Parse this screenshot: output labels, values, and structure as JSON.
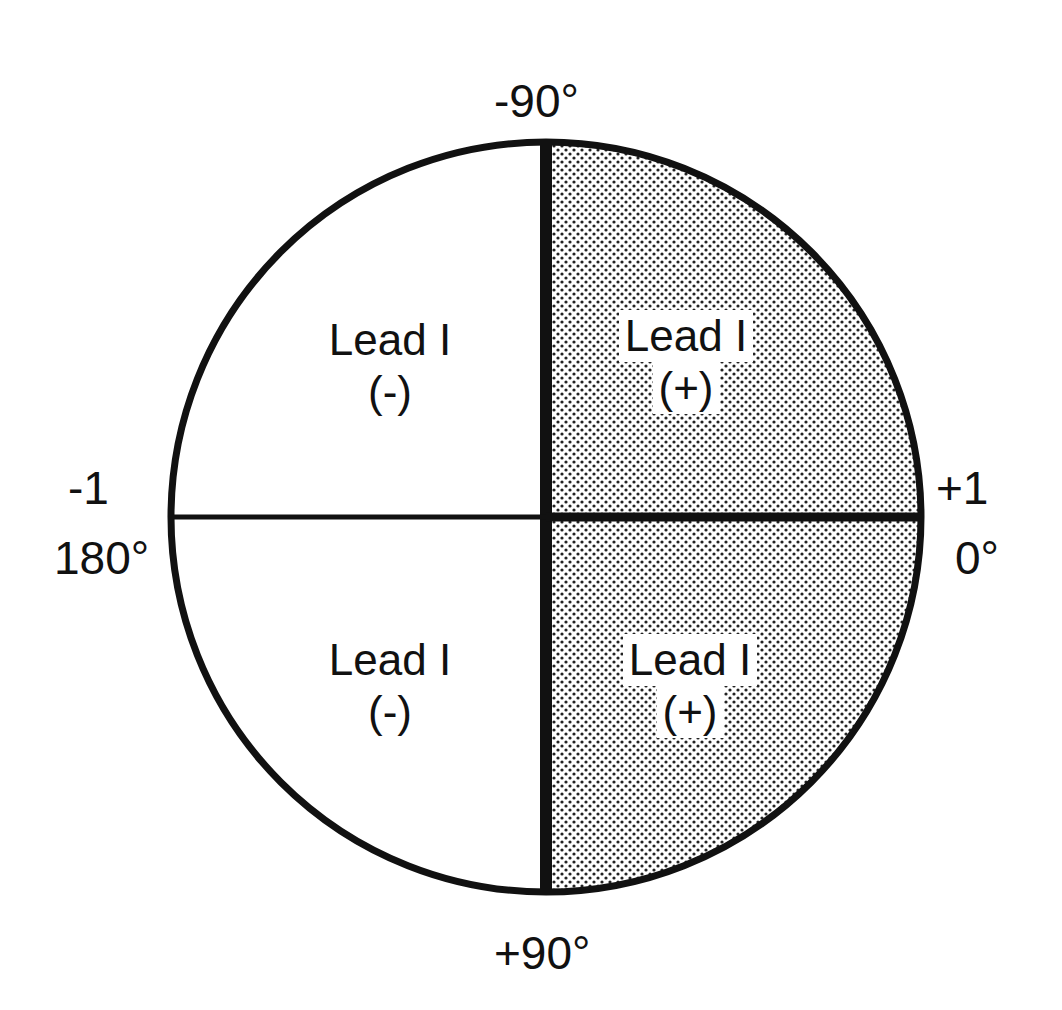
{
  "diagram": {
    "center": [
      545,
      517
    ],
    "radius": 375,
    "colors": {
      "line": "#111111",
      "shade_dot": "#222222",
      "background": "#ffffff"
    },
    "axis_labels": {
      "top": "-90°",
      "bottom": "+90°",
      "left_value": "-1",
      "left_angle": "180°",
      "right_value": "+1",
      "right_angle": "0°"
    },
    "quadrants": [
      {
        "position": "upper-left",
        "line1": "Lead I",
        "line2": "(-)",
        "shaded": false
      },
      {
        "position": "upper-right",
        "line1": "Lead I",
        "line2": "(+)",
        "shaded": true
      },
      {
        "position": "lower-left",
        "line1": "Lead I",
        "line2": "(-)",
        "shaded": false
      },
      {
        "position": "lower-right",
        "line1": "Lead I",
        "line2": "(+)",
        "shaded": true
      }
    ]
  }
}
